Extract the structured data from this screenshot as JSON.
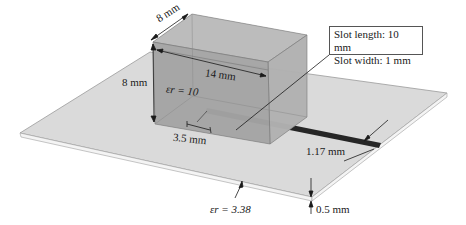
{
  "figure": {
    "block": {
      "depth_label": "8 mm",
      "height_label": "8 mm",
      "length_label": "14 mm",
      "permittivity_label": "εr = 10"
    },
    "slot": {
      "callout_line1": "Slot length: 10 mm",
      "callout_line2": "Slot width: 1 mm",
      "offset_label": "3.5 mm"
    },
    "feedline": {
      "width_label": "1.17 mm"
    },
    "substrate": {
      "permittivity_label": "εr = 3.38",
      "thickness_label": "0.5 mm"
    }
  },
  "colors": {
    "board_top": "#d9d9d9",
    "board_edge": "#f2f2f2",
    "block_front": "#a6a6a6",
    "block_side": "#b3b3b3",
    "block_top": "#bdbdbd",
    "slot": "#262626"
  }
}
